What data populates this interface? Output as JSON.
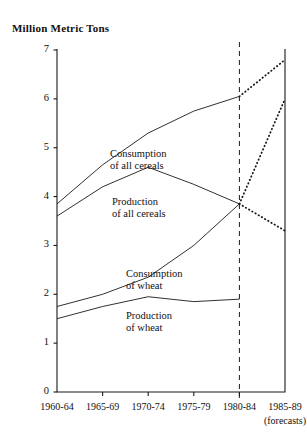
{
  "chart_data": {
    "type": "line",
    "title": "Million Metric Tons",
    "xlabel": "",
    "ylabel": "Million Metric Tons",
    "categories": [
      "1960-64",
      "1965-69",
      "1970-74",
      "1975-79",
      "1980-84",
      "1985-89"
    ],
    "ylim": [
      0,
      7
    ],
    "yticks": [
      "0",
      "1",
      "2",
      "3",
      "4",
      "5",
      "6",
      "7"
    ],
    "grid": false,
    "legend_position": "inline-annotations",
    "forecast_divider_at": "1980-84",
    "forecast_note": "(forecasts)",
    "series": [
      {
        "name": "Consumption of all cereals",
        "style": "solid",
        "values": [
          3.85,
          4.65,
          5.3,
          5.75,
          6.05,
          null
        ]
      },
      {
        "name": "Production of all cereals",
        "style": "solid",
        "values": [
          3.6,
          4.2,
          4.6,
          4.25,
          3.85,
          null
        ]
      },
      {
        "name": "Consumption of wheat",
        "style": "solid",
        "values": [
          1.75,
          2.0,
          2.35,
          3.0,
          3.85,
          null
        ]
      },
      {
        "name": "Production of wheat",
        "style": "solid",
        "values": [
          1.5,
          1.75,
          1.95,
          1.85,
          1.9,
          null
        ]
      },
      {
        "name": "Consumption of all cereals forecast",
        "style": "dotted",
        "values": [
          null,
          null,
          null,
          null,
          6.05,
          6.8
        ]
      },
      {
        "name": "Production of all cereals forecast",
        "style": "dotted",
        "values": [
          null,
          null,
          null,
          null,
          3.85,
          6.0
        ]
      },
      {
        "name": "Wheat forecast",
        "style": "dotted",
        "values": [
          null,
          null,
          null,
          null,
          3.85,
          3.3
        ]
      }
    ],
    "annotations": [
      {
        "text_line1": "Consumption",
        "text_line2": "of all cereals"
      },
      {
        "text_line1": "Production",
        "text_line2": "of all cereals"
      },
      {
        "text_line1": "Consumption",
        "text_line2": "of wheat"
      },
      {
        "text_line1": "Production",
        "text_line2": "of wheat"
      }
    ]
  }
}
